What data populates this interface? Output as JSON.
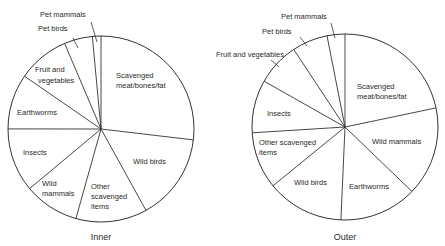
{
  "chart_data": [
    {
      "type": "pie",
      "title": "Inner",
      "start_angle_deg": 0,
      "direction": "clockwise",
      "slices": [
        {
          "label": "Scavenged meat/bones/fat",
          "value": 26.9
        },
        {
          "label": "Wild birds",
          "value": 15.1
        },
        {
          "label": "Other scavenged items",
          "value": 12.4
        },
        {
          "label": "Wild mammals",
          "value": 9.6
        },
        {
          "label": "Insects",
          "value": 11.1
        },
        {
          "label": "Earthworms",
          "value": 9.6
        },
        {
          "label": "Fruit and vegetables",
          "value": 9.0
        },
        {
          "label": "Pet birds",
          "value": 4.9
        },
        {
          "label": "Pet mammals",
          "value": 1.5
        }
      ]
    },
    {
      "type": "pie",
      "title": "Outer",
      "start_angle_deg": 0,
      "direction": "clockwise",
      "slices": [
        {
          "label": "Scavenged meat/bones/fat",
          "value": 21.7
        },
        {
          "label": "Wild mammals",
          "value": 15.5
        },
        {
          "label": "Earthworms",
          "value": 13.5
        },
        {
          "label": "Wild birds",
          "value": 13.4
        },
        {
          "label": "Other scavenged items",
          "value": 9.9
        },
        {
          "label": "Insects",
          "value": 9.2
        },
        {
          "label": "Fruit and vegetables",
          "value": 7.5
        },
        {
          "label": "Pet birds",
          "value": 6.2
        },
        {
          "label": "Pet mammals",
          "value": 3.1
        }
      ]
    }
  ],
  "charts": {
    "inner": {
      "title": "Inner",
      "labels": {
        "scavenged_1": "Scavenged",
        "scavenged_2": "meat/bones/fat",
        "wild_birds": "Wild birds",
        "other_1": "Other",
        "other_2": "scavenged",
        "other_3": "items",
        "wild_mammals_1": "Wild",
        "wild_mammals_2": "mammals",
        "insects": "Insects",
        "earthworms": "Earthworms",
        "fruit_1": "Fruit and",
        "fruit_2": "vegetables",
        "pet_birds": "Pet birds",
        "pet_mammals": "Pet mammals"
      }
    },
    "outer": {
      "title": "Outer",
      "labels": {
        "scavenged_1": "Scavenged",
        "scavenged_2": "meat/bones/fat",
        "wild_mammals": "Wild mammals",
        "earthworms": "Earthworms",
        "wild_birds": "Wild birds",
        "other_1": "Other scavenged",
        "other_2": "items",
        "insects": "Insects",
        "fruit": "Fruit and vegetables",
        "pet_birds": "Pet birds",
        "pet_mammals": "Pet mammals"
      }
    }
  }
}
